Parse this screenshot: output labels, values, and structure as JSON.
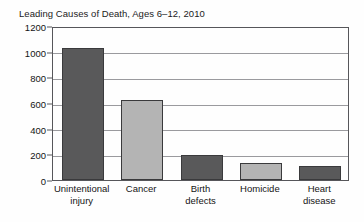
{
  "chart_data": {
    "type": "bar",
    "title": "Leading Causes of Death, Ages 6–12, 2010",
    "xlabel": "",
    "ylabel": "",
    "categories": [
      "Unintentional\ninjury",
      "Cancer",
      "Birth\ndefects",
      "Homicide",
      "Heart\ndisease"
    ],
    "values": [
      1025,
      620,
      195,
      130,
      110
    ],
    "ylim": [
      0,
      1200
    ],
    "yticks": [
      0,
      200,
      400,
      600,
      800,
      1000,
      1200
    ],
    "ytick_labels": [
      "0",
      "200",
      "400",
      "600",
      "800",
      "1000",
      "1200"
    ],
    "grid": true,
    "legend": false,
    "bar_colors": [
      "#59595a",
      "#b4b4b4",
      "#59595a",
      "#b4b4b4",
      "#59595a"
    ],
    "bar_edge_color": "#3a3a3c",
    "grid_color": "#9a9a9e",
    "axis_color": "#56565a",
    "background": "#fefefe",
    "text_color": "#141414"
  }
}
